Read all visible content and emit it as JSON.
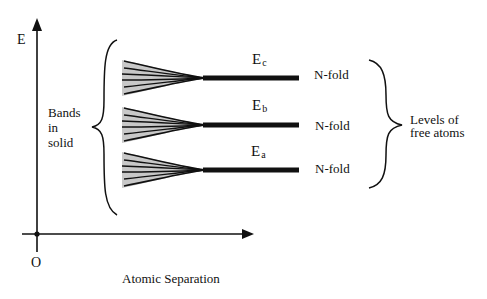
{
  "diagram": {
    "axes": {
      "y_label": "E",
      "x_label": "Atomic Separation",
      "origin_label": "O"
    },
    "levels": [
      {
        "symbol": "E",
        "subscript": "c",
        "degeneracy": "N-fold",
        "y": 78
      },
      {
        "symbol": "E",
        "subscript": "b",
        "degeneracy": "N-fold",
        "y": 125
      },
      {
        "symbol": "E",
        "subscript": "a",
        "degeneracy": "N-fold",
        "y": 170
      }
    ],
    "left_brace_label": {
      "line1": "Bands",
      "line2": "in",
      "line3": "solid"
    },
    "right_brace_label": {
      "line1": "Levels of",
      "line2": "free atoms"
    },
    "colors": {
      "ink": "#111111",
      "band_fill": "#c8c8c8",
      "background": "#ffffff"
    }
  }
}
